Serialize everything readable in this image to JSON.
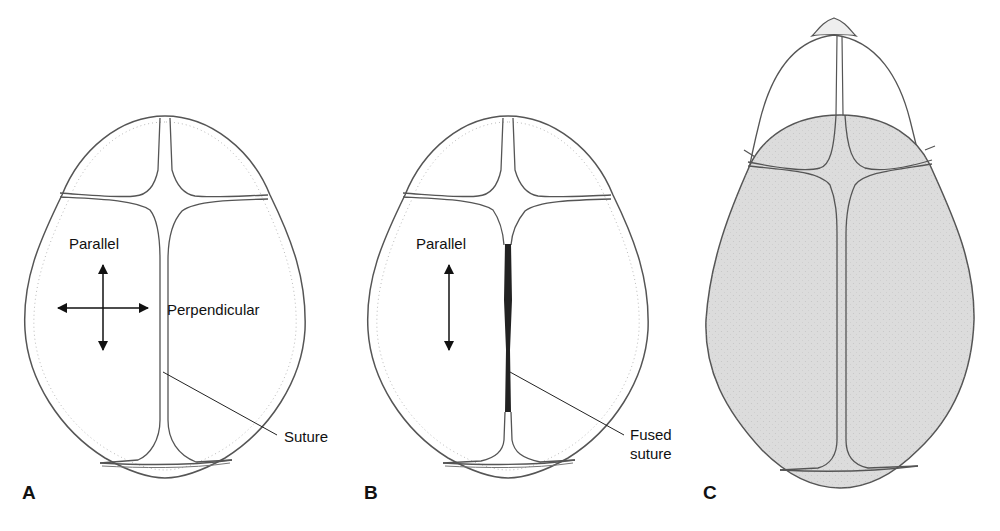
{
  "figure": {
    "panels": [
      {
        "id": "A",
        "label": "A",
        "annotations": {
          "arrow_label": "Parallel",
          "perpendicular_label": "Perpendicular",
          "pointer_label": "Suture"
        },
        "arrows": [
          "vertical-double-arrow",
          "horizontal-double-arrow"
        ]
      },
      {
        "id": "B",
        "label": "B",
        "annotations": {
          "arrow_label": "Parallel",
          "pointer_label_line1": "Fused",
          "pointer_label_line2": "suture"
        },
        "arrows": [
          "vertical-double-arrow"
        ]
      },
      {
        "id": "C",
        "label": "C",
        "annotations": {}
      }
    ],
    "colors": {
      "line": "#555555",
      "dark_fill": "#222222",
      "shaded_skull": "#dcdcdc",
      "background": "#ffffff"
    }
  }
}
